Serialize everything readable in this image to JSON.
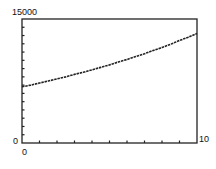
{
  "chart_data": {
    "type": "line",
    "title": "",
    "xlabel": "",
    "ylabel": "",
    "xlim": [
      0,
      10
    ],
    "ylim": [
      0,
      15000
    ],
    "grid": false,
    "legend": null,
    "tick_labels": {
      "y_max": "15000",
      "y_min": "0",
      "x_min": "0",
      "x_max": "10"
    },
    "x_ticks_count": 10,
    "y_ticks_count": 15,
    "series": [
      {
        "name": "curve",
        "style": "dotted",
        "x": [
          0,
          0.5,
          1,
          1.5,
          2,
          2.5,
          3,
          3.5,
          4,
          4.5,
          5,
          5.5,
          6,
          6.5,
          7,
          7.5,
          8,
          8.5,
          9,
          9.5,
          10
        ],
        "values": [
          6800,
          7000,
          7250,
          7500,
          7750,
          8000,
          8300,
          8550,
          8850,
          9150,
          9450,
          9800,
          10100,
          10450,
          10800,
          11200,
          11550,
          11950,
          12400,
          12800,
          13250
        ]
      }
    ]
  }
}
